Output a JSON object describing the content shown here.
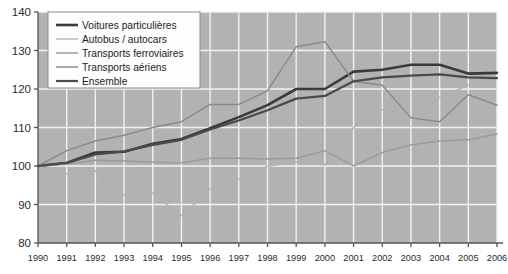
{
  "chart_data": {
    "type": "line",
    "title": "",
    "subtitle": "",
    "xlabel": "",
    "ylabel": "",
    "x": [
      1990,
      1991,
      1992,
      1993,
      1994,
      1995,
      1996,
      1997,
      1998,
      1999,
      2000,
      2001,
      2002,
      2003,
      2004,
      2005,
      2006
    ],
    "categories": [
      "1990",
      "1991",
      "1992",
      "1993",
      "1994",
      "1995",
      "1996",
      "1997",
      "1998",
      "1999",
      "2000",
      "2001",
      "2002",
      "2003",
      "2004",
      "2005",
      "2006"
    ],
    "xlim": [
      1990,
      2006
    ],
    "ylim": [
      80,
      140
    ],
    "yticks": [
      80,
      90,
      100,
      110,
      120,
      130,
      140
    ],
    "ytick_labels": [
      "80",
      "90",
      "100",
      "110",
      "120",
      "130",
      "140"
    ],
    "grid": true,
    "legend_position": "top-left",
    "base_year_index_value": 100,
    "series": [
      {
        "name": "Voitures particulières",
        "color": "#3a3a3a",
        "width": 2.6,
        "values": [
          100.0,
          100.8,
          103.5,
          103.7,
          105.8,
          107.0,
          109.8,
          112.7,
          115.8,
          120.0,
          120.0,
          124.5,
          125.0,
          126.3,
          126.3,
          124.0,
          124.2
        ]
      },
      {
        "name": "Autobus / autocars",
        "color": "#b0b0b0",
        "width": 1.3,
        "values": [
          100.0,
          98.0,
          98.7,
          92.5,
          93.0,
          87.0,
          94.0,
          96.5,
          100.0,
          101.0,
          100.3,
          110.0,
          114.7,
          112.5,
          117.8,
          121.0,
          123.0
        ]
      },
      {
        "name": "Transports ferroviaires",
        "color": "#9a9a9a",
        "width": 1.4,
        "values": [
          100.0,
          100.5,
          101.5,
          101.3,
          101.0,
          100.8,
          102.0,
          102.0,
          101.8,
          102.0,
          104.0,
          100.0,
          103.5,
          105.5,
          106.5,
          106.8,
          108.3
        ]
      },
      {
        "name": "Transports aériens",
        "color": "#8a8a8a",
        "width": 1.5,
        "values": [
          100.0,
          104.0,
          106.5,
          108.0,
          110.0,
          111.5,
          116.0,
          116.0,
          119.5,
          131.0,
          132.3,
          122.0,
          121.0,
          112.5,
          111.5,
          118.5,
          115.8
        ]
      },
      {
        "name": "Ensemble",
        "color": "#4a4a4a",
        "width": 2.2,
        "values": [
          100.0,
          100.8,
          103.0,
          103.8,
          105.5,
          106.8,
          109.5,
          111.8,
          114.5,
          117.5,
          118.2,
          122.0,
          123.0,
          123.5,
          123.8,
          123.0,
          122.8
        ]
      }
    ]
  },
  "axis": {
    "y_tick_labels": [
      "140",
      "130",
      "120",
      "110",
      "100",
      "90",
      "80"
    ],
    "x_tick_labels": [
      "1990",
      "1991",
      "1992",
      "1993",
      "1994",
      "1995",
      "1996",
      "1997",
      "1998",
      "1999",
      "2000",
      "2001",
      "2002",
      "2003",
      "2004",
      "2005",
      "2006"
    ]
  },
  "legend": {
    "items": [
      {
        "label": "Voitures particulières",
        "color": "#3a3a3a",
        "width": 2.6
      },
      {
        "label": "Autobus / autocars",
        "color": "#b0b0b0",
        "width": 1.3
      },
      {
        "label": "Transports ferroviaires",
        "color": "#9a9a9a",
        "width": 1.4
      },
      {
        "label": "Transports aériens",
        "color": "#8a8a8a",
        "width": 1.5
      },
      {
        "label": "Ensemble",
        "color": "#4a4a4a",
        "width": 2.2
      }
    ]
  },
  "style": {
    "plot_background": "#b2b2b2",
    "gridline_color": "#f2f2f2",
    "axis_color": "#555555",
    "legend_background": "#fdfdfd",
    "legend_border": "#8d8d8d",
    "page_background": "#ffffff"
  }
}
